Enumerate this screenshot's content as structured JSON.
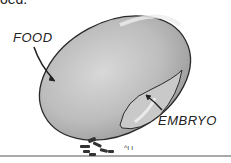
{
  "diagram": {
    "top_fragment": "oed.",
    "labels": [
      {
        "id": "food",
        "text": "FOOD"
      },
      {
        "id": "embryo",
        "text": "EMBRYO"
      }
    ],
    "colors": {
      "seed_fill": "#b8b8b8",
      "seed_highlight": "#dcdcdc",
      "outline": "#2a2a2a",
      "ground": "#555555"
    }
  }
}
